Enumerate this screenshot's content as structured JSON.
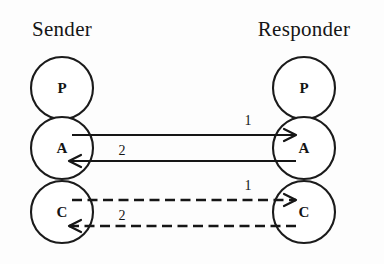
{
  "diagram": {
    "type": "protocol-layer-communication",
    "background_color": "#fdfdfd",
    "stroke_color": "#161616",
    "columns": [
      {
        "id": "sender",
        "title": "Sender",
        "title_x": 62,
        "title_y": 36,
        "center_x": 62,
        "nodes": [
          {
            "id": "sender-p",
            "label": "P",
            "cx": 62,
            "cy": 88,
            "r": 31
          },
          {
            "id": "sender-a",
            "label": "A",
            "cx": 62,
            "cy": 148,
            "r": 31
          },
          {
            "id": "sender-c",
            "label": "C",
            "cx": 62,
            "cy": 212,
            "r": 31
          }
        ]
      },
      {
        "id": "responder",
        "title": "Responder",
        "title_x": 304,
        "title_y": 36,
        "center_x": 304,
        "nodes": [
          {
            "id": "responder-p",
            "label": "P",
            "cx": 304,
            "cy": 88,
            "r": 31
          },
          {
            "id": "responder-a",
            "label": "A",
            "cx": 304,
            "cy": 148,
            "r": 31
          },
          {
            "id": "responder-c",
            "label": "C",
            "cx": 304,
            "cy": 212,
            "r": 31
          }
        ]
      }
    ],
    "edges": [
      {
        "id": "edge-a-forward",
        "label": "1",
        "style": "solid",
        "direction": "right",
        "from": "sender-a",
        "to": "responder-a",
        "x1": 72,
        "x2": 296,
        "y": 135,
        "label_x": 248,
        "label_y": 125
      },
      {
        "id": "edge-a-return",
        "label": "2",
        "style": "solid",
        "direction": "left",
        "from": "responder-a",
        "to": "sender-a",
        "x1": 296,
        "x2": 69,
        "y": 161,
        "label_x": 122,
        "label_y": 155
      },
      {
        "id": "edge-c-forward",
        "label": "1",
        "style": "dashed",
        "direction": "right",
        "from": "sender-c",
        "to": "responder-c",
        "x1": 72,
        "x2": 296,
        "y": 200,
        "label_x": 248,
        "label_y": 190
      },
      {
        "id": "edge-c-return",
        "label": "2",
        "style": "dashed",
        "direction": "left",
        "from": "responder-c",
        "to": "sender-c",
        "x1": 296,
        "x2": 69,
        "y": 226,
        "label_x": 122,
        "label_y": 220
      }
    ]
  }
}
